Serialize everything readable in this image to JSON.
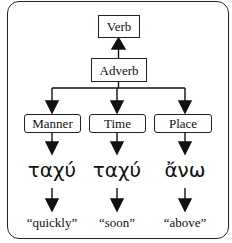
{
  "nodes": {
    "verb": "Verb",
    "adverb": "Adverb",
    "categories": [
      "Manner",
      "Time",
      "Place"
    ]
  },
  "examples": {
    "greek": [
      "ταχύ",
      "ταχύ",
      "ἄνω"
    ],
    "glosses": [
      "“quickly”",
      "“soon”",
      "“above”"
    ]
  }
}
